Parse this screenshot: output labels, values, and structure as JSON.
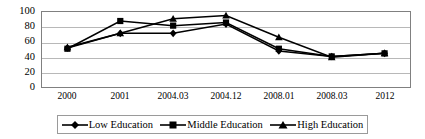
{
  "chart_data": {
    "type": "line",
    "title": "",
    "xlabel": "",
    "ylabel": "",
    "categories": [
      "2000",
      "2001",
      "2004.03",
      "2004.12",
      "2008.01",
      "2008.03",
      "2012"
    ],
    "ylim": [
      0,
      100
    ],
    "yticks": [
      0,
      20,
      40,
      60,
      80,
      100
    ],
    "ytick_labels": [
      "0",
      "20",
      "40",
      "60",
      "80",
      "100"
    ],
    "grid": true,
    "legend_position": "bottom",
    "series": [
      {
        "name": "Low Education",
        "marker": "diamond",
        "color": "#000000",
        "values": [
          52,
          71,
          71,
          83,
          48,
          41,
          45
        ]
      },
      {
        "name": "Middle Education",
        "marker": "square",
        "color": "#000000",
        "values": [
          51,
          87,
          81,
          85,
          51,
          41,
          45
        ]
      },
      {
        "name": "High Education",
        "marker": "triangle",
        "color": "#000000",
        "values": [
          53,
          71,
          90,
          94,
          66,
          40,
          45
        ]
      }
    ]
  },
  "axis": {
    "ytick_0": "0",
    "ytick_1": "20",
    "ytick_2": "40",
    "ytick_3": "60",
    "ytick_4": "80",
    "ytick_5": "100",
    "xtick_0": "2000",
    "xtick_1": "2001",
    "xtick_2": "2004.03",
    "xtick_3": "2004.12",
    "xtick_4": "2008.01",
    "xtick_5": "2008.03",
    "xtick_6": "2012"
  },
  "legend": {
    "item_0": "Low Education",
    "item_1": "Middle Education",
    "item_2": "High Education"
  }
}
